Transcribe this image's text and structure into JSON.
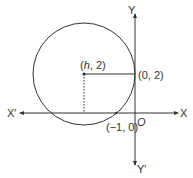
{
  "diagram": {
    "axes": {
      "x_positive_label": "X",
      "x_negative_label": "X′",
      "y_positive_label": "Y",
      "y_negative_label": "Y′",
      "origin_label": "O"
    },
    "circle": {
      "center_label_open": "(",
      "center_label_h": "h",
      "center_label_rest": ", 2)",
      "tangent_point_label": "(0, 2)",
      "x_intercept_label": "(−1, 0)"
    },
    "colors": {
      "stroke": "#333333",
      "background": "#ffffff"
    }
  }
}
